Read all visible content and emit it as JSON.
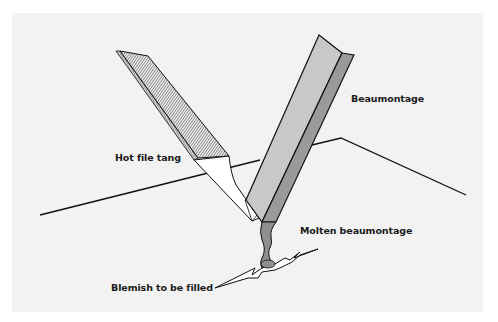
{
  "figure": {
    "type": "technical illustration",
    "panel_background": "#f2f2f2",
    "labels": {
      "beaumontage": "Beaumontage",
      "hot_file_tang": "Hot file tang",
      "molten_beaumontage": "Molten beaumontage",
      "blemish": "Blemish to be filled"
    },
    "colors": {
      "outline": "#111111",
      "beaumontage_face": "#c8c8c8",
      "beaumontage_side": "#9a9a9a",
      "molten": "#8f8f8f",
      "file_hatch": "#555555",
      "tang": "#ffffff"
    }
  }
}
